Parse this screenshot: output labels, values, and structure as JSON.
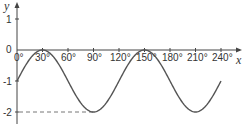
{
  "chart_data": {
    "type": "line",
    "title": "",
    "xlabel": "x",
    "ylabel": "y",
    "function": "y = sin(3x) - 1",
    "x_ticks": [
      "0°",
      "30°",
      "60°",
      "90°",
      "120°",
      "150°",
      "180°",
      "210°",
      "240°"
    ],
    "x_tick_values": [
      0,
      30,
      60,
      90,
      120,
      150,
      180,
      210,
      240
    ],
    "y_ticks": [
      "1",
      "0",
      "-1",
      "-2"
    ],
    "y_tick_values": [
      1,
      0,
      -1,
      -2
    ],
    "xlim": [
      0,
      240
    ],
    "ylim": [
      -2,
      1
    ],
    "grid": false,
    "legend": null,
    "series": [
      {
        "name": "y = sin 3x - 1",
        "x": [
          0,
          15,
          30,
          45,
          60,
          75,
          90,
          105,
          120,
          135,
          150,
          165,
          180,
          195,
          210,
          225,
          240
        ],
        "values": [
          -1,
          -0.29,
          0,
          -0.29,
          -1,
          -1.71,
          -2,
          -1.71,
          -1,
          -0.29,
          0,
          -0.29,
          -1,
          -1.71,
          -2,
          -1.71,
          -1
        ]
      }
    ],
    "annotations": [
      {
        "type": "dashed-line",
        "from": [
          0,
          -2
        ],
        "to": [
          90,
          -2
        ],
        "label": "minimum y = -2 at x = 90°"
      }
    ],
    "colors": {
      "curve": "#555555",
      "axes": "#444444",
      "dashed": "#777777"
    }
  }
}
